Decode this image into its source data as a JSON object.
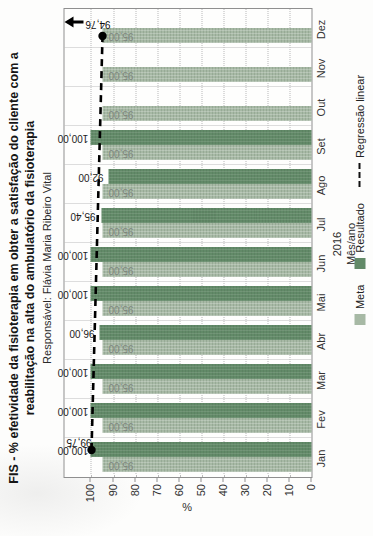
{
  "chart": {
    "title": "FIS - % efetividade da fisioterapia em obter a satisfação do cliente com a reabilitação na alta do ambulatório da fisioterapia",
    "subtitle": "Responsável: Flávia Maria Ribeiro Vital",
    "year_label": "2016",
    "xlabel": "Mês/ano",
    "ylabel": "%"
  },
  "legend": {
    "meta": "Meta",
    "resultado": "Resultado",
    "regressao": "Regressão linear"
  },
  "colors": {
    "meta": "#a7b9a5",
    "resultado": "#628a68",
    "regression": "#000000",
    "grid": "#bcbcbc",
    "plot_border": "#8f8f8f"
  },
  "chart_data": {
    "type": "bar",
    "display_rotation": "chart is drawn landscape and shown rotated 90° counter-clockwise",
    "categories": [
      "Jan",
      "Fev",
      "Mar",
      "Abr",
      "Mai",
      "Jun",
      "Jul",
      "Ago",
      "Set",
      "Out",
      "Nov",
      "Dez"
    ],
    "series": [
      {
        "name": "Meta",
        "values": [
          95,
          95,
          95,
          95,
          95,
          95,
          95,
          95,
          95,
          95,
          95,
          95
        ],
        "labels": [
          "95,00",
          "95,00",
          "95,00",
          "95,00",
          "95,00",
          "95,00",
          "95,00",
          "95,00",
          "95,00",
          "95,00",
          "95,00",
          "95,00"
        ]
      },
      {
        "name": "Resultado",
        "values": [
          100,
          100,
          100,
          96,
          100,
          100,
          95.4,
          92,
          100,
          null,
          null,
          null
        ],
        "labels": [
          "100,00",
          "100,00",
          "100,00",
          "96,00",
          "100,00",
          "100,00",
          "95,40",
          "92,00",
          "100,00",
          null,
          null,
          null
        ]
      }
    ],
    "regression": {
      "name": "Regressão linear",
      "start_value": 99.75,
      "end_value": 94.76,
      "start_label": "99,75",
      "end_label": "94,76",
      "trend_arrow": "up"
    },
    "title": "FIS - % efetividade da fisioterapia em obter a satisfação do cliente com a reabilitação na alta do ambulatório da fisioterapia",
    "xlabel": "Mês/ano",
    "ylabel": "%",
    "ylim": [
      0,
      112
    ],
    "yticks": [
      0,
      10,
      20,
      30,
      40,
      50,
      60,
      70,
      80,
      90,
      100
    ],
    "ytick_labels": [
      "0",
      "10",
      "20",
      "30",
      "40",
      "50",
      "60",
      "70",
      "80",
      "90",
      "100"
    ],
    "grid": true,
    "legend_position": "bottom"
  }
}
